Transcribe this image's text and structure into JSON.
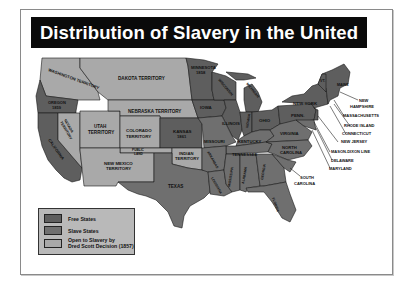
{
  "title": "Distribution of Slavery in the United States",
  "colors": {
    "free": "#5e5e5e",
    "slave": "#6f6f6f",
    "open": "#a9a9a9",
    "border": "#1a1a1a",
    "title_bg": "#0a0a0a",
    "title_fg": "#ffffff",
    "legend_bg": "#b9b9b9"
  },
  "legend": {
    "items": [
      {
        "label": "Free States",
        "category": "free"
      },
      {
        "label": "Slave States",
        "category": "slave"
      },
      {
        "label_line1": "Open to Slavery by",
        "label_line2": "Dred Scott Decision (1857)",
        "category": "open"
      }
    ]
  },
  "regions": {
    "washington": "WASHINGTON TERRITORY",
    "oregon": "OREGON",
    "oregon_year": "1859",
    "california": "CALIFORNIA",
    "nevada": "NEVADA",
    "nevada2": "TERRITORY",
    "dakota": "DAKOTA TERRITORY",
    "nebraska": "NEBRASKA TERRITORY",
    "utah": "UTAH",
    "utah2": "TERRITORY",
    "colorado": "COLORADO",
    "colorado2": "TERRITORY",
    "kansas": "KANSAS",
    "kansas_year": "1861",
    "public": "PUBLIC",
    "public2": "LAND",
    "new_mexico": "NEW MEXICO",
    "new_mexico2": "TERRITORY",
    "indian": "INDIAN",
    "indian2": "TERRITORY",
    "texas": "TEXAS",
    "minnesota": "MINNESOTA",
    "minnesota_year": "1858",
    "wisconsin": "WISCONSIN",
    "michigan": "MICHIGAN",
    "iowa": "IOWA",
    "illinois": "ILLINOIS",
    "indiana": "INDIANA",
    "ohio": "OHIO",
    "penn": "PENN.",
    "new_york": "NEW YORK",
    "vermont": "VT.",
    "maine": "MAINE",
    "missouri": "MISSOURI",
    "kentucky": "KENTUCKY",
    "virginia": "VIRGINIA",
    "tennessee": "TENNESSEE",
    "north_carolina": "NORTH",
    "north_carolina2": "CAROLINA",
    "arkansas": "ARKANSAS",
    "louisiana": "LOUISIANA",
    "mississippi": "MISSISSIPPI",
    "alabama": "ALABAMA",
    "georgia": "GEORGIA",
    "florida": "FLORIDA"
  },
  "callouts": [
    {
      "label": "NEW",
      "label2": "HAMPSHIRE"
    },
    {
      "label": "MASSACHUSETTS"
    },
    {
      "label": "RHODE ISLAND"
    },
    {
      "label": "CONNECTICUT"
    },
    {
      "label": "NEW JERSEY"
    },
    {
      "label": "MASON-DIXON LINE"
    },
    {
      "label": "DELAWARE"
    },
    {
      "label": "MARYLAND"
    },
    {
      "label": "SOUTH",
      "label2": "CAROLINA"
    }
  ]
}
